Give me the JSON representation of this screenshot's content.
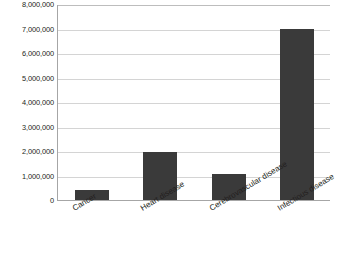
{
  "chart_data": {
    "type": "bar",
    "title": "",
    "xlabel": "",
    "ylabel": "",
    "categories": [
      "Cancer",
      "Heart disease",
      "Cerebrovascular disease",
      "Infectious disease"
    ],
    "values": [
      410000,
      1950000,
      1050000,
      7000000
    ],
    "ylim": [
      0,
      8000000
    ],
    "ytick_labels": [
      "8,000,000",
      "7,000,000",
      "6,000,000",
      "5,000,000",
      "4,000,000",
      "3,000,000",
      "2,000,000",
      "1,000,000",
      "0"
    ],
    "ytick_values": [
      8000000,
      7000000,
      6000000,
      5000000,
      4000000,
      3000000,
      2000000,
      1000000,
      0
    ],
    "grid": true,
    "legend": false,
    "series_color": "#3a3a3a",
    "gridline_color": "#d4d4d4",
    "axis_color": "#a6a6a6",
    "label_rotation_deg": -31
  }
}
